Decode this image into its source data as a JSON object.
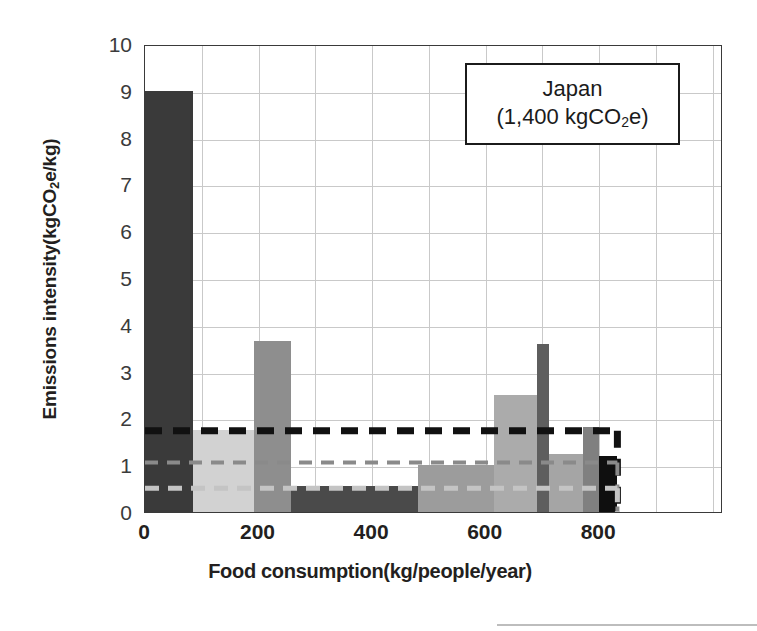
{
  "figure": {
    "background": "#ffffff",
    "frame_color": "#3a3a3a",
    "grid_color": "#c9c9c9"
  },
  "callout": {
    "country": "Japan",
    "total_prefix": "(1,400 kgCO",
    "total_sub": "2",
    "total_suffix": "e)"
  },
  "axis": {
    "y_title_prefix": "Emissions intensity(kgCO",
    "y_title_sub": "2",
    "y_title_suffix": "e/kg)",
    "x_title": "Food consumption(kg/people/year)",
    "y_ticks": [
      "10",
      "9",
      "8",
      "7",
      "6",
      "5",
      "4",
      "3",
      "2",
      "1",
      "0"
    ],
    "x_ticks": [
      "0",
      "200",
      "400",
      "600",
      "800"
    ]
  },
  "chart_data": {
    "type": "bar",
    "title": "Japan (1,400 kgCO2e)",
    "subtitle": "",
    "xlabel": "Food consumption(kg/people/year)",
    "ylabel": "Emissions intensity(kgCO2e/kg)",
    "xlim": [
      0,
      1018
    ],
    "ylim": [
      0,
      10
    ],
    "grid": true,
    "grid_x_step": 100,
    "grid_y_step": 1,
    "legend": "none",
    "annotation": "Japan (1,400 kgCO2e)",
    "bars": [
      {
        "label": "segment-1",
        "x_start": 0,
        "x_end": 85,
        "value": 9.0,
        "color": "#3a3a3a"
      },
      {
        "label": "segment-2",
        "x_start": 85,
        "x_end": 192,
        "value": 1.75,
        "color": "#d2d2d2"
      },
      {
        "label": "segment-3",
        "x_start": 192,
        "x_end": 257,
        "value": 3.65,
        "color": "#8e8e8e"
      },
      {
        "label": "segment-4",
        "x_start": 257,
        "x_end": 480,
        "value": 0.55,
        "color": "#4a4a4a"
      },
      {
        "label": "segment-5",
        "x_start": 480,
        "x_end": 615,
        "value": 1.0,
        "color": "#9c9c9c"
      },
      {
        "label": "segment-6",
        "x_start": 615,
        "x_end": 690,
        "value": 2.5,
        "color": "#ababab"
      },
      {
        "label": "segment-7",
        "x_start": 690,
        "x_end": 712,
        "value": 3.58,
        "color": "#5e5e5e"
      },
      {
        "label": "segment-8",
        "x_start": 712,
        "x_end": 772,
        "value": 1.25,
        "color": "#a5a5a5"
      },
      {
        "label": "segment-9",
        "x_start": 772,
        "x_end": 800,
        "value": 1.82,
        "color": "#808080"
      },
      {
        "label": "segment-10",
        "x_start": 800,
        "x_end": 832,
        "value": 1.2,
        "color": "#0f0f0f"
      }
    ],
    "reference_lines": [
      {
        "label": "mean-intensity-high",
        "value": 1.78,
        "x_end": 832,
        "color": "#111111",
        "thickness": 7,
        "dash": "17 11"
      },
      {
        "label": "mean-intensity-mid",
        "value": 1.1,
        "x_end": 832,
        "color": "#8a8a8a",
        "thickness": 4,
        "dash": "13 9"
      },
      {
        "label": "mean-intensity-low",
        "value": 0.55,
        "x_end": 832,
        "color": "#c4c4c4",
        "thickness": 5,
        "dash": "14 9"
      }
    ]
  }
}
